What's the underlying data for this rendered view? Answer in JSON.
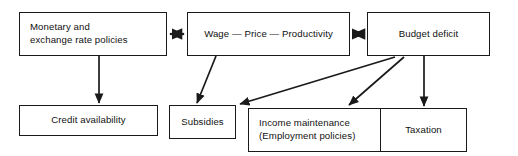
{
  "diagram": {
    "background_color": "#ffffff",
    "line_color": "#1a1a1a",
    "text_color": "#111111",
    "nodes": {
      "monetary": {
        "label": "Monetary and\nexchange rate policies"
      },
      "wage": {
        "label": "Wage — Price — Productivity"
      },
      "budget": {
        "label": "Budget deficit"
      },
      "credit": {
        "label": "Credit availability"
      },
      "subsidies": {
        "label": "Subsidies"
      },
      "income": {
        "label": "Income maintenance\n(Employment policies)"
      },
      "taxation": {
        "label": "Taxation"
      }
    },
    "connectors": [
      {
        "name": "monetary-wage-double-arrow",
        "from": "monetary",
        "to": "wage",
        "style": "double-headed-horizontal"
      },
      {
        "name": "wage-budget-double-arrow",
        "from": "wage",
        "to": "budget",
        "style": "double-headed-horizontal"
      },
      {
        "name": "monetary-credit-arrow",
        "from": "monetary",
        "to": "credit",
        "style": "single-headed-vertical"
      },
      {
        "name": "wage-subsidies-arrow",
        "from": "wage",
        "to": "subsidies",
        "style": "single-headed-diagonal"
      },
      {
        "name": "budget-subsidies-arrow",
        "from": "budget",
        "to": "subsidies",
        "style": "single-headed-diagonal"
      },
      {
        "name": "budget-income-arrow",
        "from": "budget",
        "to": "income",
        "style": "single-headed-diagonal"
      },
      {
        "name": "budget-taxation-arrow",
        "from": "budget",
        "to": "taxation",
        "style": "single-headed-vertical"
      }
    ]
  }
}
